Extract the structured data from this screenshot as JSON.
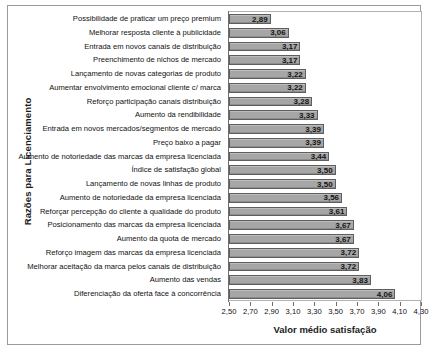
{
  "chart_data": {
    "type": "bar",
    "orientation": "horizontal",
    "title": "",
    "xlabel": "Valor médio satisfação",
    "ylabel": "Razões para Licenciamento",
    "xlim": [
      2.5,
      4.3
    ],
    "grid": false,
    "legend": null,
    "xticks": [
      "2,50",
      "2,70",
      "2,90",
      "3,10",
      "3,30",
      "3,50",
      "3,70",
      "3,90",
      "4,10",
      "4,30"
    ],
    "xtick_values": [
      2.5,
      2.7,
      2.9,
      3.1,
      3.3,
      3.5,
      3.7,
      3.9,
      4.1,
      4.3
    ],
    "bar_color": "#a6a6a6",
    "bar_edge_color": "#5e5e5e",
    "categories": [
      "Possibilidade de praticar um preço premium",
      "Melhorar resposta cliente à publicidade",
      "Entrada em novos canais de distribuição",
      "Preenchimento de nichos de mercado",
      "Lançamento de novas categorias de produto",
      "Aumentar envolvimento emocional cliente c/ marca",
      "Reforço participação canais distribuição",
      "Aumento da rendibilidade",
      "Entrada em novos mercados/segmentos de mercado",
      "Preço baixo a pagar",
      "Aumento de notoriedade das marcas da empresa licenciada",
      "Índice de satisfação global",
      "Lançamento de novas linhas de produto",
      "Aumento de notoriedade da empresa licenciada",
      "Reforçar percepção do cliente à qualidade do produto",
      "Posicionamento das marcas da empresa licenciada",
      "Aumento da quota de mercado",
      "Reforço imagem das marcas da empresa licenciada",
      "Melhorar aceitação da marca pelos canais de distribuição",
      "Aumento das vendas",
      "Diferenciação da oferta face à concorrência"
    ],
    "values": [
      2.89,
      3.06,
      3.17,
      3.17,
      3.22,
      3.22,
      3.28,
      3.33,
      3.39,
      3.39,
      3.44,
      3.5,
      3.5,
      3.56,
      3.61,
      3.67,
      3.67,
      3.72,
      3.72,
      3.83,
      4.06
    ],
    "value_labels": [
      "2,89",
      "3,06",
      "3,17",
      "3,17",
      "3,22",
      "3,22",
      "3,28",
      "3,33",
      "3,39",
      "3,39",
      "3,44",
      "3,50",
      "3,50",
      "3,56",
      "3,61",
      "3,67",
      "3,67",
      "3,72",
      "3,72",
      "3,83",
      "4,06"
    ]
  }
}
